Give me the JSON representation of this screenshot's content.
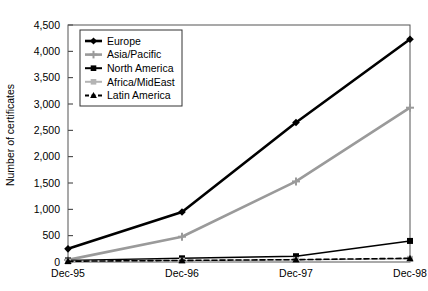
{
  "chart_data": {
    "type": "line",
    "title": "",
    "xlabel": "",
    "ylabel": "Number of certificates",
    "categories": [
      "Dec-95",
      "Dec-96",
      "Dec-97",
      "Dec-98"
    ],
    "ylim": [
      0,
      4500
    ],
    "ytick_values": [
      0,
      500,
      1000,
      1500,
      2000,
      2500,
      3000,
      3500,
      4000,
      4500
    ],
    "ytick_labels": [
      "0",
      "500",
      "1,000",
      "1,500",
      "2,000",
      "2,500",
      "3,000",
      "3,500",
      "4,000",
      "4,500"
    ],
    "grid": false,
    "legend_position": "upper-left-inside",
    "series": [
      {
        "name": "Europe",
        "values": [
          250,
          950,
          2650,
          4230
        ],
        "color": "#000000",
        "marker": "diamond",
        "line_style": "solid",
        "line_width": 2.6
      },
      {
        "name": "Asia/Pacific",
        "values": [
          40,
          480,
          1530,
          2930
        ],
        "color": "#9a9a9a",
        "marker": "plus",
        "line_style": "solid",
        "line_width": 2.6
      },
      {
        "name": "North America",
        "values": [
          30,
          70,
          110,
          400
        ],
        "color": "#000000",
        "marker": "square",
        "line_style": "solid",
        "line_width": 1.4
      },
      {
        "name": "Africa/MidEast",
        "values": [
          10,
          25,
          40,
          60
        ],
        "color": "#b4b4b4",
        "marker": "square",
        "line_style": "solid",
        "line_width": 1.4
      },
      {
        "name": "Latin America",
        "values": [
          15,
          30,
          45,
          70
        ],
        "color": "#000000",
        "marker": "triangle",
        "line_style": "dashed",
        "line_width": 1.6
      }
    ]
  },
  "axes": {
    "y_axis_label": "Number of certificates",
    "frame_color": "#555555"
  }
}
